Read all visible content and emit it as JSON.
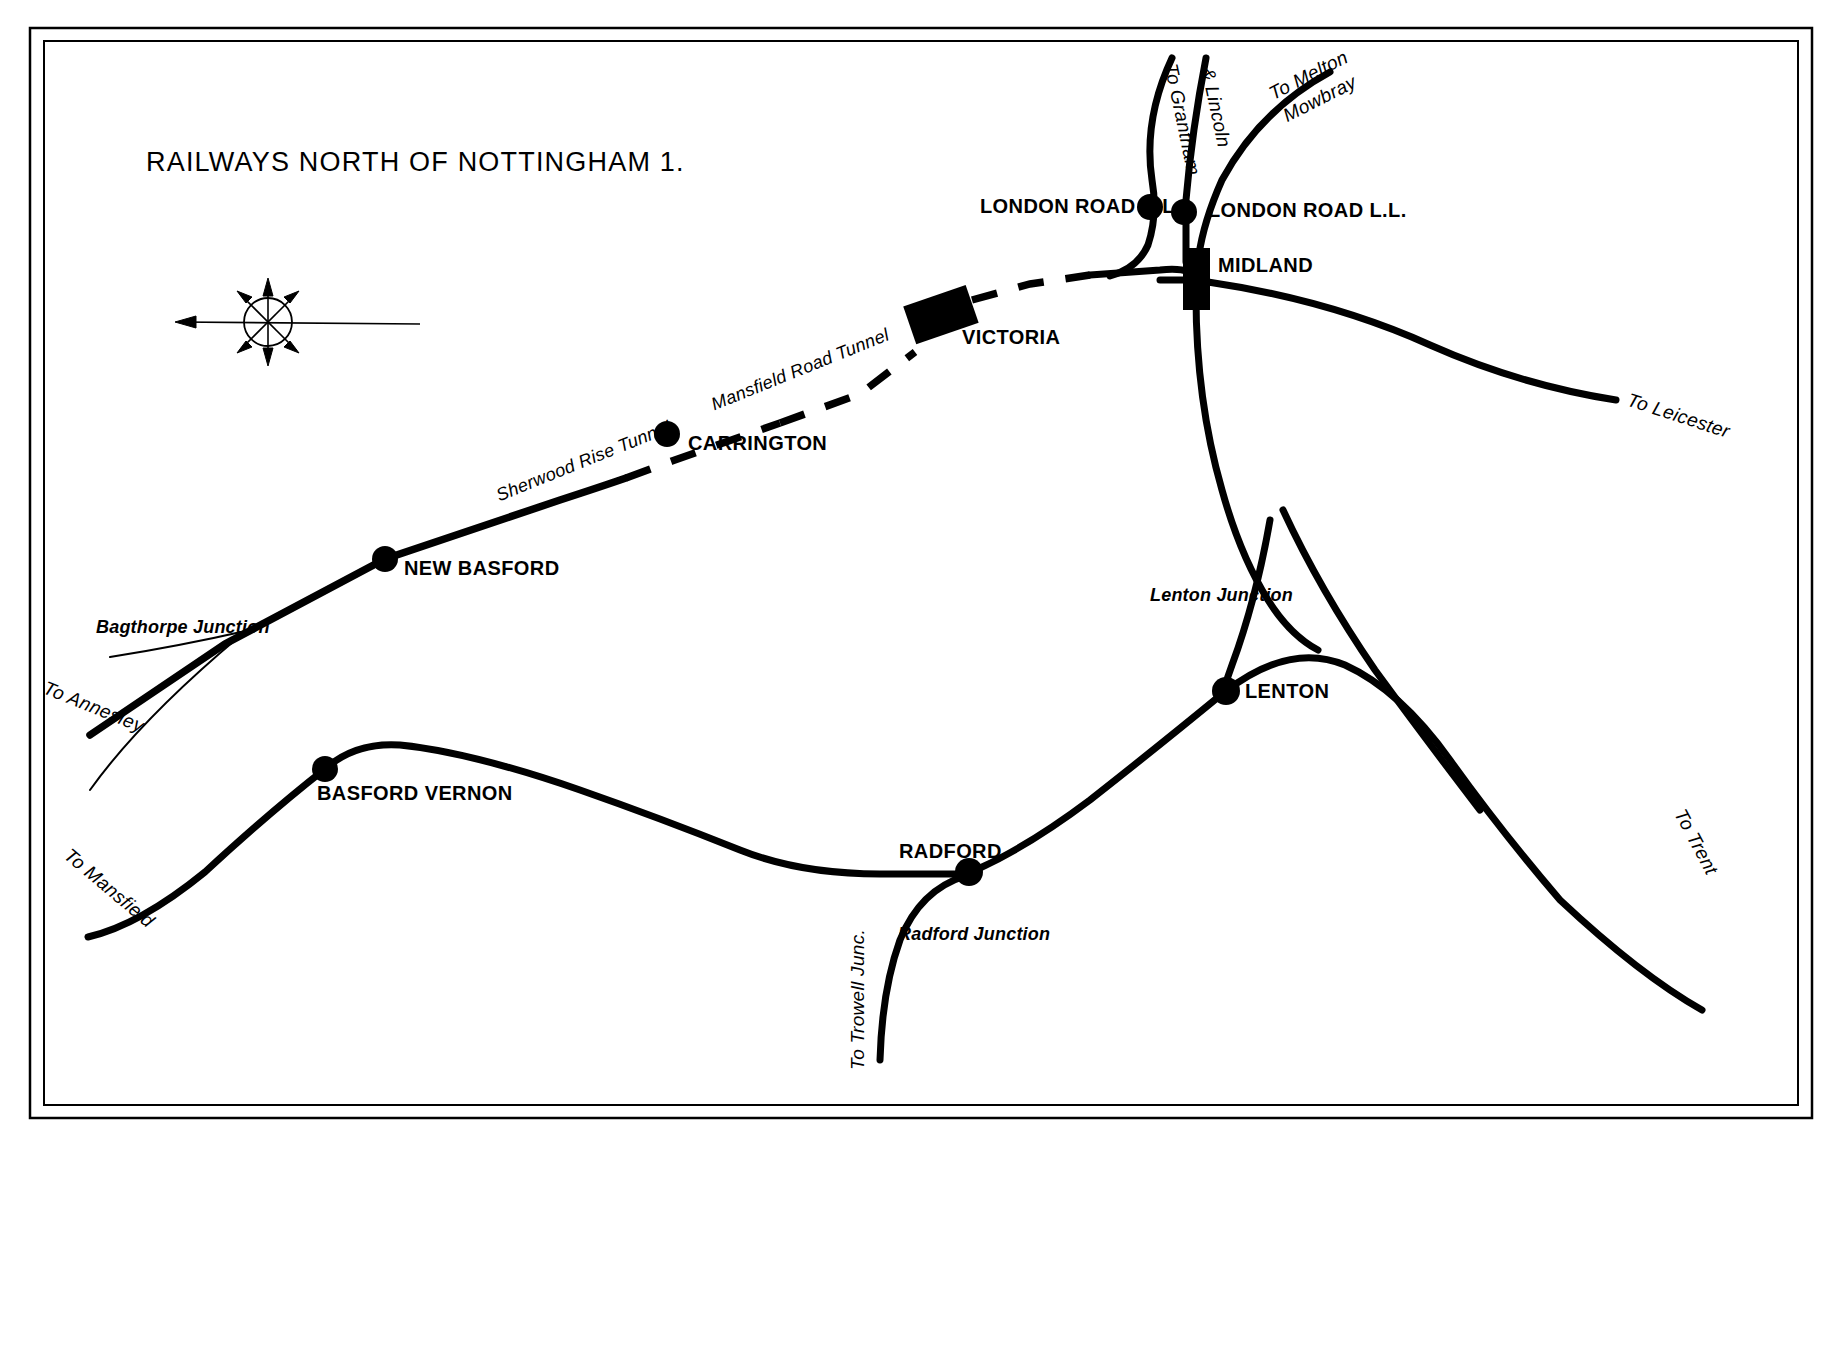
{
  "document": {
    "title": "RAILWAYS NORTH OF NOTTINGHAM 1.",
    "background_color": "#ffffff",
    "ink_color": "#000000",
    "border": {
      "outer_color": "#000000",
      "inner_color": "#000000"
    }
  },
  "compass": {
    "name": "compass-rose",
    "points": 8
  },
  "stations": [
    {
      "id": "london-road-hl",
      "label": "LONDON ROAD H.L.",
      "marker": "dot",
      "x": 1150,
      "y": 207,
      "label_x": 980,
      "label_y": 195,
      "align": "right"
    },
    {
      "id": "london-road-ll",
      "label": "LONDON ROAD L.L.",
      "marker": "dot",
      "x": 1183,
      "y": 212,
      "label_x": 1208,
      "label_y": 200,
      "align": "left"
    },
    {
      "id": "midland",
      "label": "MIDLAND",
      "marker": "box",
      "x": 1196,
      "y": 279,
      "label_x": 1218,
      "label_y": 254,
      "align": "left"
    },
    {
      "id": "victoria",
      "label": "VICTORIA",
      "marker": "box-angled",
      "x": 940,
      "y": 315,
      "label_x": 962,
      "label_y": 327,
      "align": "left"
    },
    {
      "id": "carrington",
      "label": "CARRINGTON",
      "marker": "dot",
      "x": 667,
      "y": 434,
      "label_x": 688,
      "label_y": 433,
      "align": "left"
    },
    {
      "id": "new-basford",
      "label": "NEW BASFORD",
      "marker": "dot",
      "x": 385,
      "y": 559,
      "label_x": 404,
      "label_y": 558,
      "align": "left"
    },
    {
      "id": "basford-vernon",
      "label": "BASFORD VERNON",
      "marker": "dot",
      "x": 325,
      "y": 769,
      "label_x": 317,
      "label_y": 783,
      "align": "left"
    },
    {
      "id": "radford",
      "label": "RADFORD",
      "marker": "dot",
      "x": 969,
      "y": 872,
      "label_x": 899,
      "label_y": 841,
      "align": "left"
    },
    {
      "id": "lenton",
      "label": "LENTON",
      "marker": "dot",
      "x": 1226,
      "y": 691,
      "label_x": 1245,
      "label_y": 680,
      "align": "left"
    }
  ],
  "junctions": [
    {
      "id": "bagthorpe-junction",
      "label": "Bagthorpe Junction",
      "x": 96,
      "y": 618
    },
    {
      "id": "lenton-junction",
      "label": "Lenton Junction",
      "x": 1150,
      "y": 586
    },
    {
      "id": "radford-junction",
      "label": "Radford Junction",
      "x": 898,
      "y": 925
    }
  ],
  "tunnels": [
    {
      "id": "mansfield-road-tunnel",
      "label": "Mansfield Road Tunnel",
      "x": 712,
      "y": 396,
      "rotation": -22
    },
    {
      "id": "sherwood-rise-tunnel",
      "label": "Sherwood Rise Tunnel",
      "x": 497,
      "y": 487,
      "rotation": -22
    }
  ],
  "destinations": [
    {
      "id": "to-grantham",
      "label": "To Grantham",
      "x": 1180,
      "y": 62,
      "rotation": -78
    },
    {
      "id": "and-lincoln",
      "label": "& Lincoln",
      "x": 1215,
      "y": 66,
      "rotation": -78
    },
    {
      "id": "to-melton-mowbray-line1",
      "label": "To Melton",
      "x": 1268,
      "y": 85,
      "rotation": -33
    },
    {
      "id": "to-melton-mowbray-line2",
      "label": "Mowbray",
      "x": 1278,
      "y": 107,
      "rotation": -33
    },
    {
      "id": "to-leicester",
      "label": "To Leicester",
      "x": 1632,
      "y": 388,
      "rotation": 18
    },
    {
      "id": "to-trent",
      "label": "To Trent",
      "x": 1686,
      "y": 812,
      "rotation": 62
    },
    {
      "id": "to-annesley",
      "label": "To Annesley",
      "x": 48,
      "y": 678,
      "rotation": 22
    },
    {
      "id": "to-mansfield",
      "label": "To Mansfield",
      "x": 72,
      "y": 843,
      "rotation": 40
    },
    {
      "id": "to-trowell-junc",
      "label": "To Trowell Junc.",
      "x": 844,
      "y": 955,
      "rotation": -90
    }
  ]
}
